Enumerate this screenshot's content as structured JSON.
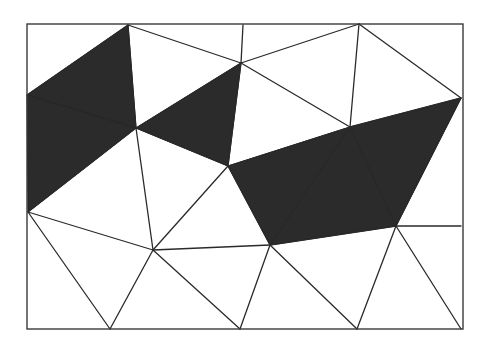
{
  "diagram": {
    "type": "triangulation",
    "frame": {
      "x": 27,
      "y": 24,
      "width": 436,
      "height": 305
    },
    "colors": {
      "shaded": "#2b2b2b",
      "background": "#ffffff",
      "edge": "#2a2a2a"
    },
    "vertices": {
      "A": [
        128,
        25
      ],
      "B": [
        243,
        25
      ],
      "C": [
        359,
        24
      ],
      "TR": [
        463,
        24
      ],
      "TL": [
        27,
        24
      ],
      "D": [
        27,
        95
      ],
      "E": [
        136,
        128
      ],
      "F": [
        241,
        63
      ],
      "G": [
        228,
        166
      ],
      "H": [
        350,
        127
      ],
      "I": [
        461,
        98
      ],
      "J": [
        28,
        212
      ],
      "K": [
        153,
        250
      ],
      "L": [
        270,
        245
      ],
      "M": [
        396,
        226
      ],
      "N": [
        461,
        226
      ],
      "BL": [
        27,
        329
      ],
      "O": [
        110,
        329
      ],
      "P": [
        240,
        329
      ],
      "Q": [
        357,
        329
      ],
      "R": [
        461,
        329
      ]
    },
    "shaded_triangles": [
      [
        "A",
        "D",
        "E"
      ],
      [
        "D",
        "E",
        "J"
      ],
      [
        "E",
        "F",
        "G"
      ],
      [
        "G",
        "H",
        "L"
      ],
      [
        "H",
        "L",
        "M"
      ],
      [
        "H",
        "I",
        "M"
      ]
    ],
    "edges": [
      [
        "A",
        "D"
      ],
      [
        "A",
        "E"
      ],
      [
        "A",
        "F"
      ],
      [
        "B",
        "F"
      ],
      [
        "F",
        "C"
      ],
      [
        "C",
        "H"
      ],
      [
        "C",
        "I"
      ],
      [
        "D",
        "E"
      ],
      [
        "E",
        "F"
      ],
      [
        "E",
        "G"
      ],
      [
        "F",
        "G"
      ],
      [
        "F",
        "H"
      ],
      [
        "G",
        "H"
      ],
      [
        "H",
        "I"
      ],
      [
        "E",
        "J"
      ],
      [
        "E",
        "K"
      ],
      [
        "G",
        "K"
      ],
      [
        "G",
        "L"
      ],
      [
        "H",
        "L"
      ],
      [
        "H",
        "M"
      ],
      [
        "I",
        "M"
      ],
      [
        "J",
        "K"
      ],
      [
        "K",
        "L"
      ],
      [
        "L",
        "M"
      ],
      [
        "M",
        "N"
      ],
      [
        "J",
        "O"
      ],
      [
        "K",
        "O"
      ],
      [
        "K",
        "P"
      ],
      [
        "L",
        "P"
      ],
      [
        "L",
        "Q"
      ],
      [
        "M",
        "Q"
      ],
      [
        "M",
        "R"
      ]
    ]
  }
}
